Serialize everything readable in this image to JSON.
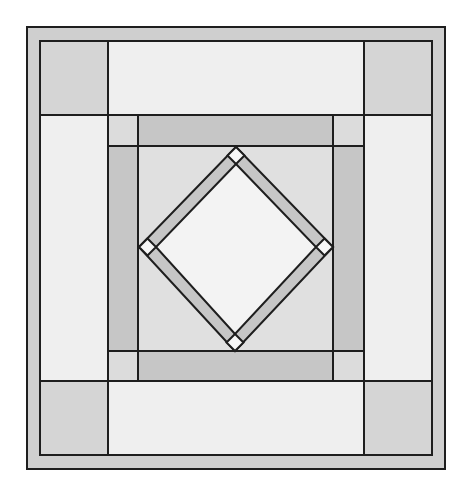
{
  "diagram": {
    "type": "quilt-block",
    "colors": {
      "background": "#ffffff",
      "outline": "#1e1e1e",
      "outer_border": "#cfcfcf",
      "corner_squares": "#d5d5d5",
      "side_panels": "#efefef",
      "small_cornerstones": "#dcdcdc",
      "frame_strips": "#c6c6c6",
      "center_square": "#e0e0e0",
      "diamond_strips": "#c6c6c6",
      "diamond_points": "#f7f7f7",
      "diamond_center": "#f3f3f3"
    },
    "geometry": {
      "outer": [
        27,
        27,
        445,
        469
      ],
      "inner": [
        40,
        41,
        432,
        455
      ],
      "col_lines": [
        108,
        138,
        333,
        364
      ],
      "row_lines": [
        115,
        146,
        351,
        381
      ],
      "diamond_outer": {
        "top": [
          236,
          147
        ],
        "right": [
          333,
          247
        ],
        "bottom": [
          235,
          351
        ],
        "left": [
          139,
          247
        ]
      },
      "strip_offset": 8.5
    }
  }
}
